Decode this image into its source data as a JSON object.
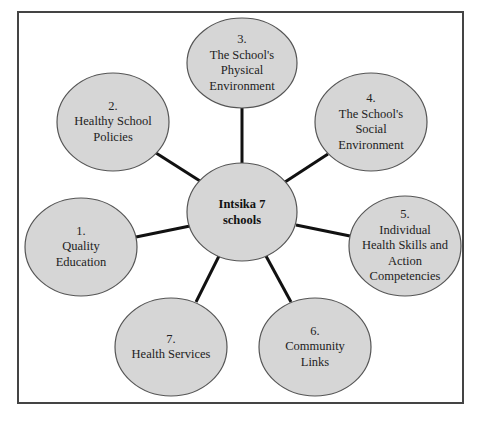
{
  "diagram": {
    "type": "hub-and-spoke",
    "colors": {
      "node_fill": "#d6d6d6",
      "node_stroke": "#555555",
      "edge": "#111111",
      "frame": "#444444"
    },
    "center": {
      "id": "hub",
      "label_lines": [
        "Intsika 7",
        "schools"
      ],
      "cx": 242,
      "cy": 212,
      "rx": 55,
      "ry": 49
    },
    "nodes": [
      {
        "id": "n1",
        "number": "1.",
        "label_lines": [
          "Quality",
          "Education"
        ],
        "cx": 81,
        "cy": 247,
        "rx": 56,
        "ry": 49
      },
      {
        "id": "n2",
        "number": "2.",
        "label_lines": [
          "Healthy School",
          "Policies"
        ],
        "cx": 113,
        "cy": 122,
        "rx": 56,
        "ry": 49
      },
      {
        "id": "n3",
        "number": "3.",
        "label_lines": [
          "The School's",
          "Physical",
          "Environment"
        ],
        "cx": 242,
        "cy": 63,
        "rx": 55,
        "ry": 45
      },
      {
        "id": "n4",
        "number": "4.",
        "label_lines": [
          "The School's",
          "Social",
          "Environment"
        ],
        "cx": 371,
        "cy": 122,
        "rx": 56,
        "ry": 49
      },
      {
        "id": "n5",
        "number": "5.",
        "label_lines": [
          "Individual",
          "Health Skills and",
          "Action",
          "Competencies"
        ],
        "cx": 405,
        "cy": 246,
        "rx": 56,
        "ry": 50
      },
      {
        "id": "n6",
        "number": "6.",
        "label_lines": [
          "Community",
          "Links"
        ],
        "cx": 315,
        "cy": 347,
        "rx": 56,
        "ry": 49
      },
      {
        "id": "n7",
        "number": "7.",
        "label_lines": [
          "Health Services"
        ],
        "cx": 171,
        "cy": 347,
        "rx": 56,
        "ry": 49
      }
    ],
    "edges": [
      {
        "from": "hub",
        "to": "n1",
        "x1": 190,
        "y1": 226,
        "x2": 136,
        "y2": 237
      },
      {
        "from": "hub",
        "to": "n2",
        "x1": 200,
        "y1": 181,
        "x2": 156,
        "y2": 153
      },
      {
        "from": "hub",
        "to": "n3",
        "x1": 242,
        "y1": 163,
        "x2": 242,
        "y2": 108
      },
      {
        "from": "hub",
        "to": "n4",
        "x1": 285,
        "y1": 182,
        "x2": 328,
        "y2": 154
      },
      {
        "from": "hub",
        "to": "n5",
        "x1": 296,
        "y1": 225,
        "x2": 350,
        "y2": 236
      },
      {
        "from": "hub",
        "to": "n6",
        "x1": 266,
        "y1": 256,
        "x2": 291,
        "y2": 302
      },
      {
        "from": "hub",
        "to": "n7",
        "x1": 219,
        "y1": 256,
        "x2": 196,
        "y2": 302
      }
    ]
  }
}
